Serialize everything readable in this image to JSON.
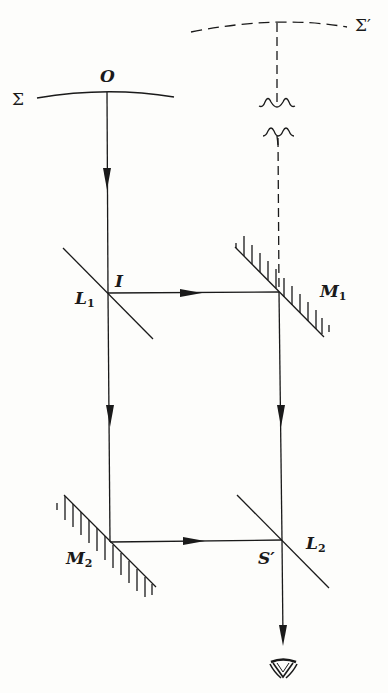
{
  "diagram": {
    "type": "interferometer",
    "labels": {
      "sigma": "Σ",
      "sigma_prime": "Σ′",
      "origin": "O",
      "incidence": "I",
      "splitter1_main": "L",
      "splitter1_sub": "1",
      "splitter2_main": "L",
      "splitter2_sub": "2",
      "mirror1_main": "M",
      "mirror1_sub": "1",
      "mirror2_main": "M",
      "mirror2_sub": "2",
      "image_point": "S′"
    },
    "elements": [
      {
        "id": "Σ",
        "kind": "wavefront",
        "style": "solid"
      },
      {
        "id": "Σ′",
        "kind": "virtual-wavefront",
        "style": "dashed"
      },
      {
        "id": "L1",
        "kind": "beam-splitter"
      },
      {
        "id": "M1",
        "kind": "mirror"
      },
      {
        "id": "M2",
        "kind": "mirror"
      },
      {
        "id": "L2",
        "kind": "beam-splitter"
      },
      {
        "id": "eye",
        "kind": "observer"
      }
    ],
    "color": "#1a1a1a"
  }
}
